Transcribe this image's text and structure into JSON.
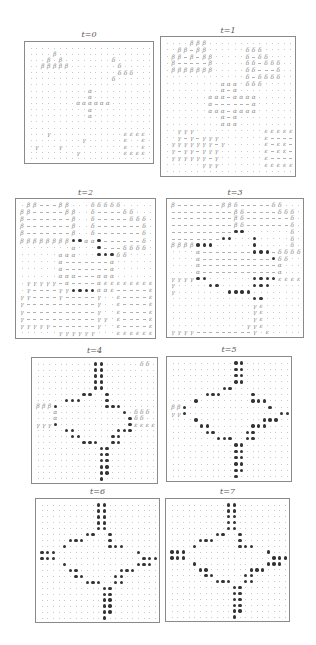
{
  "figure": {
    "legend": {
      ".": "empty-site",
      "-": "dash",
      "b": "β",
      "d": "δ",
      "a": "α",
      "g": "γ",
      "e": "ε",
      "*": "bullet"
    },
    "panels": [
      {
        "label": "t=0",
        "box": {
          "x": 24,
          "y": 41,
          "w": 130,
          "h": 123
        },
        "title_y": 30,
        "rows": [
          ".....................",
          "....b................",
          "...b.b........d......",
          "..bbbbb........d.....",
          "...............ddd...",
          "..............d......",
          ".....................",
          "..........a..........",
          "..........a..........",
          "........aaaaaa.......",
          "..........a..........",
          "..........a..........",
          ".....................",
          ".....................",
          "...g............eeee.",
          ".........g......e..e.",
          ".g...g..........e..e.",
          "........g.......eeee.",
          "....................."
        ]
      },
      {
        "label": "t=1",
        "box": {
          "x": 160,
          "y": 36,
          "w": 136,
          "h": 141
        },
        "title_y": 26,
        "rows": [
          "....bbb..............",
          "..bb-bb......ddd.....",
          ".bb-b-bb.....d-dd....",
          ".b-----b.....dd-ddd..",
          ".bbbbbbb.....dd---d..",
          ".............d-dddd..",
          ".........aaa.ddd.....",
          ".........a-a.........",
          ".......aaa-aaaa......",
          ".......a------a......",
          ".......aaa-aaaa......",
          ".........a-a.........",
          ".........aaa.........",
          "..ggg...........eeeeee",
          "..g-g-ggg.......e----e",
          ".ggggggg-g......e-ee-e",
          ".g-gg-ggg.......e-ee-e",
          ".gggggg-g.......e----e",
          "......ggg.......eeeeee",
          "....................."
        ]
      },
      {
        "label": "t=2",
        "box": {
          "x": 15,
          "y": 198,
          "w": 141,
          "h": 141
        },
        "title_y": 188,
        "rows": [
          ".bb---bb...ddddd.....",
          "bb-----bb..d----dd...",
          "b-------b..d-----ddd.",
          "b-------b..d-------d.",
          "b-------b..d-------d.",
          "bbbbbbbb**aa*------d.",
          "........a...*---dddd.",
          "......aaa...***dd....",
          "......a-------a......",
          "......a-------a......",
          "......aaa---aaa......",
          ".ggggg-a----aeeeeeeee",
          ".g----gg****aae-----e",
          "gg----g-----g..e----e",
          "g-----------g..e----e",
          "g-----------g..e----e",
          "g-----------gg.e----e",
          "ggggg-------g..e----e",
          "......gggggg...eeeeee"
        ]
      },
      {
        "label": "t=3",
        "box": {
          "x": 166,
          "y": 198,
          "w": 138,
          "h": 140
        },
        "title_y": 188,
        "rows": [
          "b-------bbd-----dd...",
          "----------bd-----ddd.",
          "----------bd-------d.",
          "----------bd-------d.",
          "----------**.......d.",
          "--------**...*.....d.",
          "bbbb***......*.....d.",
          "....a--------***-dddd",
          "....a-----------*dd..",
          "....a------------a...",
          "....a------------a...",
          "gggg**.......****eeeeee",
          "g.....**.....***.....",
          "g........****........",
          ".............**......",
          ".............ge......",
          ".............ge......",
          ".............ge......",
          "............gge......",
          "gggg---------g.e....."
        ]
      },
      {
        "label": "t=4",
        "box": {
          "x": 31,
          "y": 357,
          "w": 127,
          "h": 127
        },
        "title_y": 346,
        "rows": [
          "..........**......dd.",
          "..........**.........",
          "..........**.........",
          "..........**.........",
          "..........**.........",
          "........**..*........",
          ".....***....*........",
          "bbb*........***......",
          "...a...........*.ddd.",
          "...a............*dd..",
          "ggg*............*eeee",
          ".....**.......***....",
          "......**.....**......",
          "........***..**......",
          "...........**........",
          "...........**........",
          "...........**........",
          "...........**........",
          "...........**........",
          "...........*........."
        ]
      },
      {
        "label": "t=5",
        "box": {
          "x": 166,
          "y": 356,
          "w": 126,
          "h": 126
        },
        "title_y": 345,
        "rows": [
          "...........**........",
          "...........**........",
          "...........**........",
          "...........**........",
          ".........**..........",
          "......***.....*......",
          "....*.........***....",
          "bb*..............*...",
          "gg*................****",
          "....*...........***..",
          ".....**.......***....",
          "......**.....**......",
          "........***..**......",
          "...........**........",
          "...........**........",
          "...........**........",
          "...........**........",
          "...........**........",
          "...........*........."
        ]
      },
      {
        "label": "t=6",
        "box": {
          "x": 35,
          "y": 498,
          "w": 125,
          "h": 125
        },
        "title_y": 487,
        "rows": [
          "..........**.........",
          "..........**.........",
          "..........**.........",
          "..........**.........",
          "..........**.........",
          "........**..*........",
          ".....***....*........",
          "....*.......***......",
          "***..............*...",
          "***...............*****",
          "....*............***.",
          ".....**.......***....",
          "......**.....**......",
          "........***..**......",
          "...........**........",
          "...........**........",
          "...........**........",
          "...........**........",
          "...........**........",
          "...........*........."
        ]
      },
      {
        "label": "t=7",
        "box": {
          "x": 165,
          "y": 498,
          "w": 125,
          "h": 124
        },
        "title_y": 487,
        "rows": [
          "..........**.........",
          "..........**.........",
          "..........**.........",
          "..........**.........",
          "..........**.........",
          "........**..*........",
          ".....***....*........",
          "....*.......***......",
          "***..............*...",
          "***...............*****",
          "....*............***.",
          ".....**.......***....",
          "......**.....**......",
          "........***..**......",
          "...........**........",
          "...........**........",
          "...........**........",
          "...........**........",
          "...........**........",
          "...........*........."
        ]
      }
    ]
  }
}
